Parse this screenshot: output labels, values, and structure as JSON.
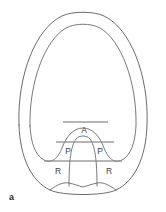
{
  "figure": {
    "caption": "a",
    "labels": [
      {
        "name": "label-a-apex",
        "text": "A",
        "x": 84,
        "y": 131
      },
      {
        "name": "label-p-left",
        "text": "P",
        "x": 68,
        "y": 152
      },
      {
        "name": "label-p-right",
        "text": "P",
        "x": 100,
        "y": 152
      },
      {
        "name": "label-r-left",
        "text": "R",
        "x": 58,
        "y": 172
      },
      {
        "name": "label-r-right",
        "text": "R",
        "x": 109,
        "y": 172
      }
    ],
    "reference_lines": [
      {
        "name": "reference-line-upper",
        "x1": 63,
        "x2": 108,
        "y": 122
      },
      {
        "name": "reference-line-middle",
        "x1": 56,
        "x2": 114,
        "y": 142
      },
      {
        "name": "reference-line-lower",
        "x1": 44,
        "x2": 122,
        "y": 161
      }
    ],
    "colors": {
      "outer_contour": "#5a5a5a",
      "inner_contour": "#616161",
      "reference_line": "#8d8d8d",
      "label_text": "#3d3d3d",
      "background": "#ffffff"
    },
    "paths": {
      "outer_contour": "M 19 125 C 17 75 36 28 62 16 C 72 11 94 11 104 16 C 130 28 149 75 147 125 C 146 157 135 181 116 190 C 104 196 62 196 50 190 C 31 181 20 157 19 125 Z",
      "inner_contour": "M 30 126 C 29 82 45 40 66 28 C 75 23 91 23 100 28 C 121 40 137 82 136 126 C 135 143 131 155 122 160 C 114 164 108 158 104 148 C 100 137 93 128 83 128 C 73 128 66 137 62 148 C 58 158 52 164 44 160 C 35 155 31 143 30 126 Z",
      "central_dome": "M 69 186 C 69 160 71 146 76 139 C 79 135 87 135 90 139 C 95 146 97 160 97 186",
      "basal_curve": "M 50 190 C 58 184 64 182 69 183 C 74 184 79 186 83 187 C 87 186 92 184 97 183 C 102 182 108 184 116 190"
    }
  }
}
